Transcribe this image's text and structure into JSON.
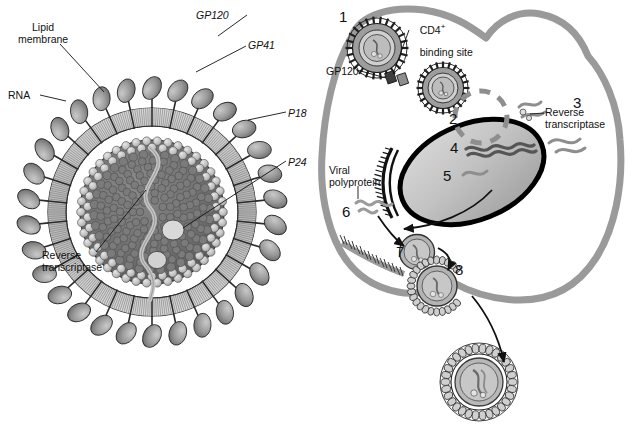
{
  "figure": {
    "panels": [
      {
        "id": "virion-structure",
        "name": "HIV virion cross-section",
        "labels": [
          {
            "key": "lipid_membrane",
            "text": "Lipid\nmembrane",
            "italic": false,
            "x": 18,
            "y": 22
          },
          {
            "key": "rna",
            "text": "RNA",
            "italic": false,
            "x": 8,
            "y": 90
          },
          {
            "key": "reverse_transcriptase",
            "text": "Reverse\ntranscriptase",
            "italic": false,
            "x": 42,
            "y": 250
          },
          {
            "key": "gp120",
            "text": "GP120",
            "italic": true,
            "x": 196,
            "y": 10
          },
          {
            "key": "gp41",
            "text": "GP41",
            "italic": true,
            "x": 248,
            "y": 40
          },
          {
            "key": "p18",
            "text": "P18",
            "italic": true,
            "x": 288,
            "y": 108
          },
          {
            "key": "p24",
            "text": "P24",
            "italic": true,
            "x": 288,
            "y": 157
          }
        ]
      },
      {
        "id": "replication-cycle",
        "name": "HIV infection and replication cycle in a CD4+ cell",
        "labels": [
          {
            "key": "cd4_binding_site",
            "text": "CD4",
            "sup": "+",
            "text2": "binding site",
            "italic": false,
            "x": 408,
            "y": 9
          },
          {
            "key": "gp120_cycle",
            "text": "GP120",
            "italic": false,
            "x": 326,
            "y": 66
          },
          {
            "key": "reverse_transcriptase_cycle",
            "text": "Reverse\ntranscriptase",
            "italic": false,
            "x": 545,
            "y": 107
          },
          {
            "key": "viral_polyprotein",
            "text": "Viral\npolyprotein",
            "italic": false,
            "x": 329,
            "y": 165
          }
        ],
        "steps": [
          {
            "n": "1",
            "x": 339,
            "y": 9,
            "desc": "Virion binds CD4 receptor via GP120"
          },
          {
            "n": "2",
            "x": 449,
            "y": 111,
            "desc": "Uncoating of viral core in cytoplasm"
          },
          {
            "n": "3",
            "x": 573,
            "y": 95,
            "desc": "Reverse transcriptase copies viral RNA to DNA"
          },
          {
            "n": "4",
            "x": 450,
            "y": 140,
            "desc": "Proviral DNA integrates into host genome"
          },
          {
            "n": "5",
            "x": 443,
            "y": 168,
            "desc": "Transcription of viral RNA"
          },
          {
            "n": "6",
            "x": 342,
            "y": 204,
            "desc": "Translation of viral polyprotein"
          },
          {
            "n": "7",
            "x": 396,
            "y": 244,
            "desc": "Assembly of new viral core"
          },
          {
            "n": "8",
            "x": 455,
            "y": 262,
            "desc": "Budding of new virion through cell membrane"
          }
        ]
      }
    ],
    "colors": {
      "outline": "#1a1a1a",
      "spike_fill": "#8e8e8e",
      "membrane_fill": "#b9b9b9",
      "core_fill": "#6e6e6e",
      "capsid_dot": "#c9c9c9",
      "cell_membrane": "#9a9a9a",
      "nucleus_fill": "#c2c2c2",
      "nucleus_outline": "#000000",
      "background": "#ffffff"
    }
  }
}
